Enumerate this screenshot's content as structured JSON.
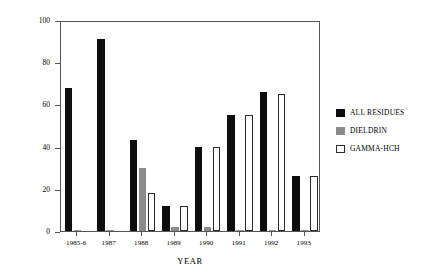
{
  "chart_data": {
    "type": "bar",
    "title": "",
    "xlabel": "YEAR",
    "ylabel": "% SAMPLES ANALYSED",
    "ylim": [
      0,
      100
    ],
    "yticks": [
      0,
      20,
      40,
      60,
      80,
      100
    ],
    "grid": false,
    "legend_position": "right",
    "categories": [
      "1985-6",
      "1987",
      "1988",
      "1989",
      "1990",
      "1991",
      "1992",
      "1993"
    ],
    "series": [
      {
        "name": "ALL RESIDUES",
        "color": "#0d0d0d",
        "values": [
          68,
          91,
          43,
          12,
          40,
          55,
          66,
          26
        ]
      },
      {
        "name": "DIELDRIN",
        "color": "#8a8a8a",
        "values": [
          0,
          0,
          30,
          2,
          2,
          0,
          0,
          0
        ]
      },
      {
        "name": "GAMMA-HCH",
        "color": "#ffffff",
        "values": [
          0,
          0,
          18,
          12,
          40,
          55,
          65,
          26
        ]
      }
    ]
  },
  "legend": {
    "items": [
      {
        "label": "ALL RESIDUES"
      },
      {
        "label": "DIELDRIN"
      },
      {
        "label": "GAMMA-HCH"
      }
    ]
  }
}
